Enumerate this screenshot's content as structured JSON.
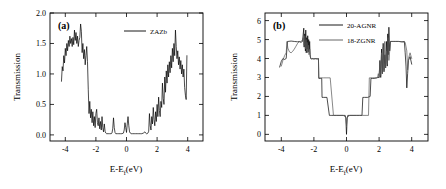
{
  "figure": {
    "background": "#ffffff",
    "panels": [
      "a",
      "b"
    ]
  },
  "chart_data": [
    {
      "type": "line",
      "panel_label": "(a)",
      "title": "",
      "xlabel": "E-E",
      "xlabel_sub": "f",
      "xlabel_unit": "(eV)",
      "ylabel": "Transmission",
      "xlim": [
        -5,
        5
      ],
      "ylim": [
        -0.1,
        2.0
      ],
      "xticks": [
        -4,
        -2,
        0,
        2,
        4
      ],
      "xticklabels": [
        "-4",
        "-2",
        "0",
        "2",
        "4"
      ],
      "yticks": [
        0.0,
        0.5,
        1.0,
        1.5,
        2.0
      ],
      "yticklabels": [
        "0.0",
        "0.5",
        "1.0",
        "1.5",
        "2.0"
      ],
      "grid": false,
      "legend_position": "top-center",
      "series": [
        {
          "name": "ZAZb",
          "color": "#000000",
          "x": [
            -4.25,
            -4.2,
            -4.15,
            -4.1,
            -4.05,
            -4.0,
            -3.95,
            -3.9,
            -3.85,
            -3.8,
            -3.75,
            -3.7,
            -3.65,
            -3.6,
            -3.55,
            -3.5,
            -3.45,
            -3.4,
            -3.35,
            -3.3,
            -3.25,
            -3.2,
            -3.15,
            -3.1,
            -3.05,
            -3.0,
            -2.95,
            -2.9,
            -2.85,
            -2.8,
            -2.75,
            -2.7,
            -2.65,
            -2.6,
            -2.55,
            -2.5,
            -2.45,
            -2.4,
            -2.35,
            -2.3,
            -2.25,
            -2.2,
            -2.15,
            -2.1,
            -2.05,
            -2.0,
            -1.95,
            -1.9,
            -1.85,
            -1.8,
            -1.75,
            -1.7,
            -1.65,
            -1.6,
            -1.55,
            -1.5,
            -1.45,
            -1.4,
            -1.35,
            -1.3,
            -1.2,
            -1.1,
            -1.0,
            -0.95,
            -0.9,
            -0.85,
            -0.8,
            -0.75,
            -0.7,
            -0.6,
            -0.5,
            -0.4,
            -0.3,
            -0.2,
            -0.15,
            -0.1,
            -0.05,
            0.0,
            0.05,
            0.1,
            0.15,
            0.2,
            0.25,
            0.3,
            0.4,
            0.5,
            0.6,
            0.7,
            0.8,
            0.9,
            1.0,
            1.1,
            1.2,
            1.25,
            1.3,
            1.35,
            1.4,
            1.45,
            1.5,
            1.55,
            1.6,
            1.65,
            1.7,
            1.75,
            1.8,
            1.85,
            1.9,
            1.95,
            2.0,
            2.05,
            2.1,
            2.15,
            2.2,
            2.25,
            2.3,
            2.35,
            2.4,
            2.45,
            2.5,
            2.55,
            2.6,
            2.65,
            2.7,
            2.75,
            2.8,
            2.85,
            2.9,
            2.95,
            3.0,
            3.05,
            3.1,
            3.15,
            3.2,
            3.25,
            3.3,
            3.35,
            3.4,
            3.45,
            3.5,
            3.55,
            3.6,
            3.65,
            3.7,
            3.75,
            3.8,
            3.85,
            3.9,
            3.95,
            4.0
          ],
          "y": [
            0.88,
            1.12,
            1.05,
            1.3,
            1.18,
            1.42,
            1.3,
            1.5,
            1.38,
            1.55,
            1.45,
            1.62,
            1.5,
            1.58,
            1.45,
            1.6,
            1.48,
            1.72,
            1.55,
            1.68,
            1.5,
            1.62,
            1.45,
            1.55,
            1.6,
            1.82,
            1.7,
            1.35,
            1.5,
            1.25,
            1.4,
            1.15,
            1.3,
            1.45,
            1.2,
            0.75,
            0.35,
            0.55,
            0.28,
            0.42,
            0.2,
            0.38,
            0.15,
            0.3,
            0.12,
            0.35,
            0.42,
            0.2,
            0.15,
            0.28,
            0.1,
            0.22,
            0.08,
            0.3,
            0.12,
            0.05,
            0.18,
            0.06,
            0.03,
            0.02,
            0.02,
            0.02,
            0.02,
            0.03,
            0.1,
            0.28,
            0.12,
            0.04,
            0.02,
            0.02,
            0.02,
            0.02,
            0.02,
            0.03,
            0.08,
            0.2,
            0.12,
            0.04,
            0.18,
            0.3,
            0.15,
            0.05,
            0.03,
            0.02,
            0.02,
            0.02,
            0.02,
            0.02,
            0.02,
            0.02,
            0.02,
            0.03,
            0.05,
            0.03,
            0.02,
            0.02,
            0.03,
            0.06,
            0.35,
            0.15,
            0.08,
            0.3,
            0.18,
            0.45,
            0.25,
            0.15,
            0.38,
            0.22,
            0.5,
            0.3,
            0.62,
            0.4,
            0.3,
            0.55,
            0.45,
            0.85,
            0.6,
            0.5,
            0.95,
            0.7,
            1.05,
            0.85,
            1.15,
            0.95,
            1.2,
            1.02,
            1.3,
            1.1,
            1.42,
            1.2,
            1.5,
            1.3,
            1.72,
            1.45,
            1.25,
            1.38,
            1.15,
            1.28,
            1.08,
            1.22,
            1.0,
            1.15,
            0.95,
            1.08,
            0.78,
            0.65,
            0.58,
            1.3
          ]
        }
      ]
    },
    {
      "type": "line",
      "panel_label": "(b)",
      "title": "",
      "xlabel": "E-E",
      "xlabel_sub": "f",
      "xlabel_unit": "(eV)",
      "ylabel": "Transmission",
      "xlim": [
        -5,
        5
      ],
      "ylim": [
        -0.35,
        6.4
      ],
      "xticks": [
        -4,
        -2,
        0,
        2,
        4
      ],
      "xticklabels": [
        "-4",
        "-2",
        "0",
        "2",
        "4"
      ],
      "yticks": [
        0,
        1,
        2,
        3,
        4,
        5,
        6
      ],
      "yticklabels": [
        "0",
        "1",
        "2",
        "3",
        "4",
        "5",
        "6"
      ],
      "grid": false,
      "legend_position": "top-center",
      "series": [
        {
          "name": "20-AGNR",
          "color": "#000000",
          "x": [
            -4.1,
            -4.0,
            -3.9,
            -3.8,
            -3.7,
            -3.62,
            -3.6,
            -3.4,
            -3.2,
            -3.0,
            -2.9,
            -2.8,
            -2.7,
            -2.62,
            -2.6,
            -2.56,
            -2.52,
            -2.5,
            -2.47,
            -2.44,
            -2.41,
            -2.38,
            -2.35,
            -2.32,
            -2.29,
            -2.26,
            -2.23,
            -2.2,
            -2.15,
            -2.1,
            -2.0,
            -1.9,
            -1.8,
            -1.72,
            -1.7,
            -1.6,
            -1.52,
            -1.5,
            -1.4,
            -1.2,
            -1.05,
            -1.0,
            -0.9,
            -0.8,
            -0.6,
            -0.4,
            -0.2,
            -0.08,
            -0.04,
            -0.02,
            0.0,
            0.02,
            0.04,
            0.08,
            0.2,
            0.4,
            0.6,
            0.8,
            0.95,
            1.0,
            1.1,
            1.3,
            1.45,
            1.5,
            1.6,
            1.7,
            1.85,
            1.9,
            2.0,
            2.05,
            2.1,
            2.15,
            2.2,
            2.25,
            2.3,
            2.35,
            2.4,
            2.45,
            2.5,
            2.53,
            2.56,
            2.6,
            2.65,
            2.7,
            2.8,
            2.9,
            3.0,
            3.2,
            3.4,
            3.55,
            3.6,
            3.65,
            3.7,
            3.75,
            3.8,
            3.9,
            4.0
          ],
          "y": [
            3.55,
            3.85,
            4.0,
            3.95,
            4.0,
            4.9,
            4.9,
            4.92,
            4.9,
            4.88,
            4.9,
            4.85,
            4.9,
            5.6,
            4.6,
            5.3,
            4.4,
            5.5,
            4.3,
            5.1,
            4.5,
            5.2,
            4.35,
            5.0,
            4.45,
            4.9,
            4.2,
            4.0,
            3.98,
            4.0,
            3.98,
            4.0,
            3.98,
            4.0,
            2.95,
            2.95,
            2.95,
            1.95,
            1.95,
            1.95,
            1.0,
            1.0,
            1.0,
            1.0,
            1.0,
            1.0,
            1.0,
            1.0,
            0.85,
            0.4,
            0.0,
            0.4,
            0.85,
            1.0,
            1.0,
            1.0,
            1.0,
            1.0,
            1.0,
            1.95,
            1.95,
            1.95,
            2.0,
            2.95,
            2.95,
            2.95,
            2.98,
            3.0,
            3.0,
            3.9,
            3.0,
            4.5,
            3.2,
            4.8,
            3.3,
            4.2,
            3.5,
            4.9,
            3.6,
            5.3,
            4.2,
            5.65,
            4.4,
            4.9,
            4.9,
            4.9,
            4.9,
            4.9,
            4.88,
            4.9,
            4.3,
            3.6,
            2.45,
            3.2,
            3.9,
            4.1,
            3.7
          ]
        },
        {
          "name": "18-ZGNR",
          "color": "#555555",
          "x": [
            -4.0,
            -3.9,
            -3.8,
            -3.7,
            -3.65,
            -3.6,
            -3.5,
            -3.4,
            -3.3,
            -3.2,
            -3.1,
            -3.0,
            -2.9,
            -2.8,
            -2.72,
            -2.65,
            -2.6,
            -2.56,
            -2.52,
            -2.48,
            -2.45,
            -2.42,
            -2.38,
            -2.34,
            -2.3,
            -2.26,
            -2.22,
            -2.18,
            -2.12,
            -2.05,
            -2.0,
            -1.9,
            -1.8,
            -1.72,
            -1.7,
            -1.6,
            -1.5,
            -1.4,
            -1.2,
            -1.0,
            -0.8,
            -0.6,
            -0.4,
            -0.2,
            -0.05,
            0.0,
            0.05,
            0.2,
            0.4,
            0.6,
            0.8,
            1.0,
            1.2,
            1.35,
            1.4,
            1.5,
            1.6,
            1.7,
            1.8,
            1.9,
            1.95,
            2.0,
            2.05,
            2.1,
            2.15,
            2.2,
            2.25,
            2.3,
            2.35,
            2.4,
            2.45,
            2.5,
            2.55,
            2.6,
            2.7,
            2.8,
            2.9,
            3.0,
            3.2,
            3.4,
            3.6,
            3.7,
            3.75,
            3.8,
            3.9,
            4.0
          ],
          "y": [
            3.6,
            3.9,
            4.15,
            4.3,
            4.9,
            4.55,
            4.35,
            4.3,
            4.38,
            4.5,
            4.65,
            4.8,
            4.88,
            4.9,
            4.95,
            5.1,
            4.7,
            5.2,
            4.5,
            5.0,
            4.4,
            4.85,
            4.3,
            4.7,
            4.2,
            4.5,
            4.1,
            4.0,
            3.98,
            3.98,
            3.98,
            3.98,
            3.98,
            3.98,
            2.98,
            2.98,
            2.98,
            2.98,
            2.98,
            2.98,
            1.0,
            1.0,
            1.0,
            1.0,
            0.9,
            0.5,
            0.9,
            1.0,
            1.0,
            1.0,
            1.0,
            1.0,
            1.0,
            1.0,
            2.98,
            2.98,
            2.98,
            2.98,
            2.98,
            2.98,
            3.2,
            3.0,
            3.8,
            3.1,
            4.3,
            3.2,
            4.6,
            3.4,
            4.9,
            3.5,
            4.4,
            3.7,
            5.1,
            3.9,
            4.9,
            4.9,
            4.9,
            4.9,
            4.9,
            4.88,
            4.85,
            4.4,
            3.4,
            4.0,
            4.3,
            4.0
          ]
        }
      ]
    }
  ]
}
